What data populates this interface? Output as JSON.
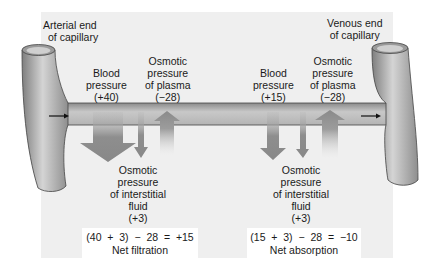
{
  "arterial_end": {
    "line1": "Arterial end",
    "line2": "of capillary"
  },
  "venous_end": {
    "line1": "Venous end",
    "line2": "of capillary"
  },
  "arterial": {
    "blood_pressure": {
      "line1": "Blood",
      "line2": "pressure",
      "value": "(+40)"
    },
    "plasma_osmotic": {
      "line1": "Osmotic",
      "line2": "pressure",
      "line3": "of plasma",
      "value": "(−28)"
    },
    "interstitial_osmotic": {
      "line1": "Osmotic",
      "line2": "pressure",
      "line3": "of interstitial",
      "line4": "fluid",
      "value": "(+3)"
    },
    "equation": "(40  +  3)  −  28  =  +15",
    "result": "Net filtration"
  },
  "venous": {
    "blood_pressure": {
      "line1": "Blood",
      "line2": "pressure",
      "value": "(+15)"
    },
    "plasma_osmotic": {
      "line1": "Osmotic",
      "line2": "pressure",
      "line3": "of plasma",
      "value": "(−28)"
    },
    "interstitial_osmotic": {
      "line1": "Osmotic",
      "line2": "pressure",
      "line3": "of interstitial",
      "line4": "fluid",
      "value": "(+3)"
    },
    "equation": "(15  +  3)  −  28  =  −10",
    "result": "Net absorption"
  },
  "colors": {
    "panel": "#efefef",
    "vessel": "#a9a9a9",
    "arrow": "#8c8c8c",
    "outline": "#555555"
  }
}
